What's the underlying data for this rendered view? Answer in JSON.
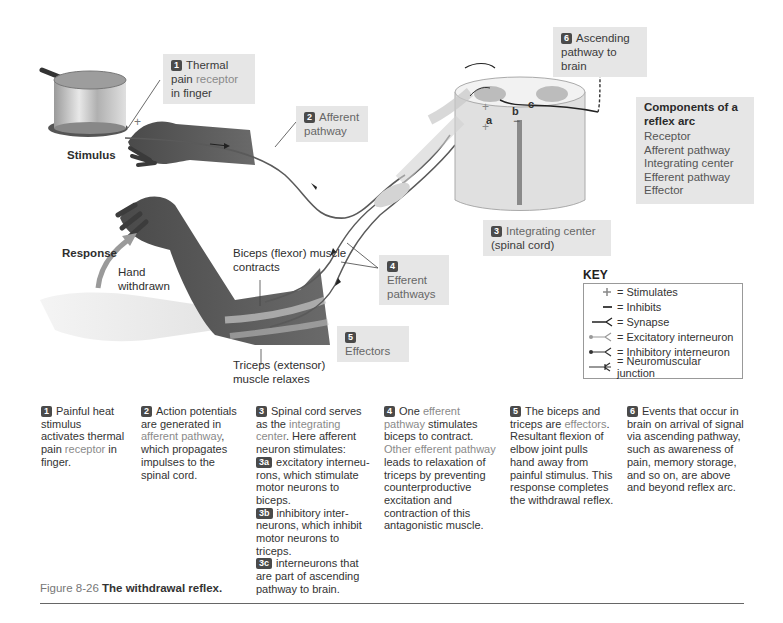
{
  "figure": {
    "number_label": "Figure 8-26",
    "title": "The withdrawal reflex."
  },
  "illustration": {
    "stimulus_label": "Stimulus",
    "response_label": "Response",
    "hand_withdrawn_label": "Hand withdrawn",
    "biceps_label": "Biceps (flexor) muscle contracts",
    "triceps_label": "Triceps (extensor) muscle relaxes",
    "cord_letters": [
      "a",
      "b",
      "c"
    ],
    "callouts": [
      {
        "num": "1",
        "text_a": "Thermal",
        "text_b": "pain ",
        "text_hl": "receptor",
        "text_c": "in finger"
      },
      {
        "num": "2",
        "text_a": "Afferent",
        "text_b": "pathway"
      },
      {
        "num": "3",
        "text_a": "Integrating center",
        "text_b": "(spinal cord)"
      },
      {
        "num": "4",
        "text_a": "Efferent",
        "text_b": "pathways"
      },
      {
        "num": "5",
        "text_a": "Effectors"
      },
      {
        "num": "6",
        "text_a": "Ascending",
        "text_b": "pathway to brain"
      }
    ]
  },
  "components": {
    "title": "Components of a reflex arc",
    "items": [
      "Receptor",
      "Afferent pathway",
      "Integrating center",
      "Efferent pathway",
      "Effector"
    ]
  },
  "key": {
    "title": "KEY",
    "items": [
      {
        "symbol": "plus",
        "label": "= Stimulates"
      },
      {
        "symbol": "minus",
        "label": "= Inhibits"
      },
      {
        "symbol": "synapse",
        "label": "= Synapse"
      },
      {
        "symbol": "excitatory",
        "label": "= Excitatory interneuron"
      },
      {
        "symbol": "inhibitory",
        "label": "= Inhibitory interneuron"
      },
      {
        "symbol": "nmj",
        "label": "= Neuromuscular junction"
      }
    ]
  },
  "steps": [
    {
      "num": "1",
      "pre": "Painful heat stimulus activates thermal pain ",
      "hl": "receptor",
      "post": " in finger."
    },
    {
      "num": "2",
      "pre": "Action potentials are generated in ",
      "hl": "afferent pathway",
      "post": ", which propagates impulses to the spinal cord."
    },
    {
      "num": "3",
      "pre": "Spinal cord serves as the ",
      "hl": "integrating center",
      "post": ". Here afferent neuron stimulates:",
      "subs": [
        {
          "num": "3a",
          "text": "excitatory interneu-rons, which stimulate motor neurons to biceps."
        },
        {
          "num": "3b",
          "text": "inhibitory inter-neurons, which inhibit motor neurons to triceps."
        },
        {
          "num": "3c",
          "text": "interneurons that are part of ascending pathway to brain."
        }
      ]
    },
    {
      "num": "4",
      "pre": "One ",
      "hl": "efferent pathway",
      "post": " stimulates biceps to contract.",
      "hl2": "Other efferent pathway",
      "post2": " leads to relaxation of triceps by preventing counterproductive excitation and contraction of this antagonistic muscle."
    },
    {
      "num": "5",
      "pre": "The biceps and triceps are ",
      "hl": "effectors",
      "post": ". Resultant flexion of elbow joint pulls hand away from painful stimulus. This response completes the withdrawal reflex."
    },
    {
      "num": "6",
      "pre": "Events that occur in brain on arrival of signal via ascending pathway, such as awareness of pain, memory storage, and so on, are above and beyond reflex arc.",
      "hl": "",
      "post": ""
    }
  ],
  "colors": {
    "label_box": "#e6e6e6",
    "badge": "#4a4a4a",
    "highlight_text": "#8a8a8a",
    "skin": "#5a5a5a",
    "cord": "#e2e2e2",
    "grey_matter": "#bdbdbd"
  }
}
